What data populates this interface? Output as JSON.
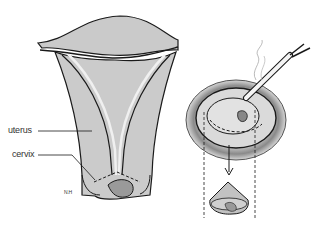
{
  "diagram": {
    "labels": [
      {
        "id": "uterus",
        "text": "uterus"
      },
      {
        "id": "cervix",
        "text": "cervix"
      }
    ],
    "signature": "N.H",
    "panels": [
      {
        "name": "uterus-cross-section",
        "description": "Cross section of uterus with cone-shaped cervical excision marked by dashed lines"
      },
      {
        "name": "cervix-excision-view",
        "description": "Frontal view of cervix with instrument excising cone; arrow down to excised cone specimen"
      }
    ],
    "colors": {
      "tissue": "#c8c8c8",
      "outline": "#1a1a1a",
      "canal": "#e6e6e6",
      "background": "#ffffff"
    }
  }
}
